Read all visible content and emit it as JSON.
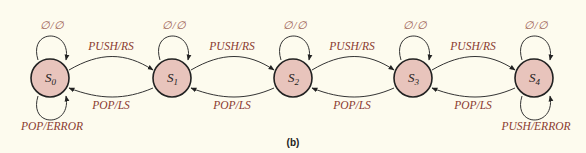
{
  "diagram": {
    "type": "state-machine",
    "colors": {
      "background": "#fdfbee",
      "node_fill": "#e8c4bc",
      "label": "#8a3a2e"
    },
    "states": [
      {
        "id": "S0",
        "name": "S",
        "sub": "0",
        "cx": 50,
        "cy": 78
      },
      {
        "id": "S1",
        "name": "S",
        "sub": "1",
        "cx": 172,
        "cy": 78
      },
      {
        "id": "S2",
        "name": "S",
        "sub": "2",
        "cx": 293,
        "cy": 78
      },
      {
        "id": "S3",
        "name": "S",
        "sub": "3",
        "cx": 413,
        "cy": 78
      },
      {
        "id": "S4",
        "name": "S",
        "sub": "4",
        "cx": 534,
        "cy": 78
      }
    ],
    "self_loops_top": {
      "label": "∅/∅"
    },
    "forward_label": "PUSH/RS",
    "backward_label": "POP/LS",
    "s0_bottom_loop": "POP/ERROR",
    "s4_bottom_loop": "PUSH/ERROR",
    "transitions": [
      {
        "from": "S0",
        "to": "S0",
        "label": "∅/∅"
      },
      {
        "from": "S0",
        "to": "S0",
        "label": "POP/ERROR"
      },
      {
        "from": "S0",
        "to": "S1",
        "label": "PUSH/RS"
      },
      {
        "from": "S1",
        "to": "S0",
        "label": "POP/LS"
      },
      {
        "from": "S1",
        "to": "S1",
        "label": "∅/∅"
      },
      {
        "from": "S1",
        "to": "S2",
        "label": "PUSH/RS"
      },
      {
        "from": "S2",
        "to": "S1",
        "label": "POP/LS"
      },
      {
        "from": "S2",
        "to": "S2",
        "label": "∅/∅"
      },
      {
        "from": "S2",
        "to": "S3",
        "label": "PUSH/RS"
      },
      {
        "from": "S3",
        "to": "S2",
        "label": "POP/LS"
      },
      {
        "from": "S3",
        "to": "S3",
        "label": "∅/∅"
      },
      {
        "from": "S3",
        "to": "S4",
        "label": "PUSH/RS"
      },
      {
        "from": "S4",
        "to": "S3",
        "label": "POP/LS"
      },
      {
        "from": "S4",
        "to": "S4",
        "label": "∅/∅"
      },
      {
        "from": "S4",
        "to": "S4",
        "label": "PUSH/ERROR"
      }
    ]
  },
  "caption": "(b)"
}
